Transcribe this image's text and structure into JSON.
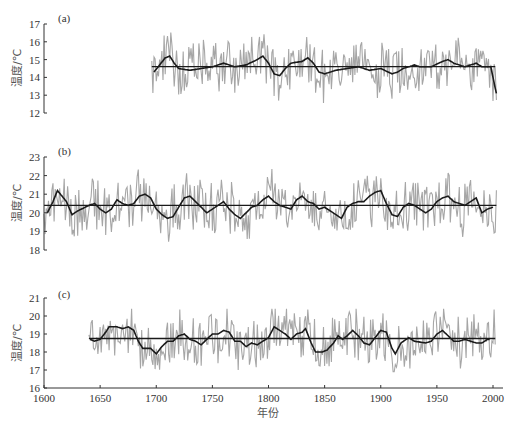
{
  "figure": {
    "xlabel": "年份",
    "x_ticks": [
      "1600",
      "1650",
      "1700",
      "1750",
      "1800",
      "1850",
      "1900",
      "1950",
      "2000"
    ],
    "colors": {
      "raw": "#a6a6a6",
      "smooth": "#1a1a1a",
      "mean": "#1a1a1a",
      "axis": "#333333"
    }
  },
  "chart_data": [
    {
      "type": "line",
      "panel": "(a)",
      "title": "",
      "xlabel": "",
      "ylabel": "温度/℃",
      "xlim": [
        1600,
        2005
      ],
      "ylim": [
        12,
        17
      ],
      "y_ticks": [
        "12",
        "13",
        "14",
        "15",
        "16",
        "17"
      ],
      "series": [
        {
          "name": "annual",
          "start": 1696,
          "end": 2003,
          "mean": 14.6,
          "min": 12.4,
          "max": 17.3
        },
        {
          "name": "smoothed",
          "start": 1698,
          "end": 2003,
          "points": [
            [
              1698,
              14.3
            ],
            [
              1703,
              14.7
            ],
            [
              1708,
              15.1
            ],
            [
              1712,
              15.2
            ],
            [
              1716,
              14.8
            ],
            [
              1720,
              14.5
            ],
            [
              1730,
              14.4
            ],
            [
              1740,
              14.5
            ],
            [
              1750,
              14.6
            ],
            [
              1760,
              14.8
            ],
            [
              1765,
              14.7
            ],
            [
              1770,
              14.6
            ],
            [
              1780,
              14.7
            ],
            [
              1790,
              15.0
            ],
            [
              1795,
              15.2
            ],
            [
              1800,
              14.8
            ],
            [
              1805,
              14.2
            ],
            [
              1810,
              14.1
            ],
            [
              1815,
              14.5
            ],
            [
              1820,
              14.8
            ],
            [
              1830,
              14.9
            ],
            [
              1835,
              15.1
            ],
            [
              1840,
              14.8
            ],
            [
              1845,
              14.3
            ],
            [
              1850,
              14.2
            ],
            [
              1860,
              14.4
            ],
            [
              1870,
              14.5
            ],
            [
              1880,
              14.6
            ],
            [
              1890,
              14.4
            ],
            [
              1900,
              14.5
            ],
            [
              1910,
              14.2
            ],
            [
              1915,
              14.3
            ],
            [
              1920,
              14.5
            ],
            [
              1930,
              14.7
            ],
            [
              1935,
              14.6
            ],
            [
              1945,
              14.6
            ],
            [
              1955,
              14.9
            ],
            [
              1960,
              15.0
            ],
            [
              1965,
              14.8
            ],
            [
              1975,
              14.6
            ],
            [
              1985,
              14.8
            ],
            [
              1990,
              14.6
            ],
            [
              1998,
              14.6
            ],
            [
              2003,
              13.1
            ]
          ]
        },
        {
          "name": "mean",
          "value": 14.6,
          "start": 1696,
          "end": 2002
        }
      ]
    },
    {
      "type": "line",
      "panel": "(b)",
      "ylabel": "温度/℃",
      "xlim": [
        1600,
        2005
      ],
      "ylim": [
        18,
        23
      ],
      "y_ticks": [
        "18",
        "19",
        "20",
        "21",
        "22",
        "23"
      ],
      "series": [
        {
          "name": "annual",
          "start": 1600,
          "end": 2003,
          "mean": 20.4,
          "min": 18.1,
          "max": 22.6
        },
        {
          "name": "smoothed",
          "start": 1603,
          "end": 2000,
          "points": [
            [
              1603,
              20.0
            ],
            [
              1608,
              20.6
            ],
            [
              1612,
              21.2
            ],
            [
              1616,
              20.9
            ],
            [
              1620,
              20.6
            ],
            [
              1625,
              19.9
            ],
            [
              1630,
              20.1
            ],
            [
              1640,
              20.4
            ],
            [
              1645,
              20.5
            ],
            [
              1650,
              20.2
            ],
            [
              1655,
              20.0
            ],
            [
              1660,
              20.2
            ],
            [
              1665,
              20.7
            ],
            [
              1670,
              20.5
            ],
            [
              1675,
              20.4
            ],
            [
              1680,
              20.5
            ],
            [
              1685,
              20.9
            ],
            [
              1690,
              21.0
            ],
            [
              1695,
              20.8
            ],
            [
              1700,
              20.2
            ],
            [
              1705,
              19.9
            ],
            [
              1710,
              19.7
            ],
            [
              1715,
              19.8
            ],
            [
              1720,
              20.3
            ],
            [
              1725,
              20.8
            ],
            [
              1730,
              20.9
            ],
            [
              1735,
              20.6
            ],
            [
              1740,
              20.3
            ],
            [
              1745,
              20.0
            ],
            [
              1750,
              20.2
            ],
            [
              1755,
              20.4
            ],
            [
              1760,
              20.6
            ],
            [
              1765,
              20.2
            ],
            [
              1770,
              19.9
            ],
            [
              1775,
              19.7
            ],
            [
              1780,
              20.0
            ],
            [
              1785,
              20.3
            ],
            [
              1790,
              20.4
            ],
            [
              1795,
              20.7
            ],
            [
              1800,
              20.9
            ],
            [
              1805,
              20.6
            ],
            [
              1810,
              20.4
            ],
            [
              1815,
              20.3
            ],
            [
              1820,
              20.2
            ],
            [
              1825,
              20.7
            ],
            [
              1830,
              20.9
            ],
            [
              1835,
              20.6
            ],
            [
              1840,
              20.5
            ],
            [
              1845,
              20.2
            ],
            [
              1850,
              20.3
            ],
            [
              1855,
              20.1
            ],
            [
              1860,
              19.9
            ],
            [
              1865,
              19.7
            ],
            [
              1870,
              20.3
            ],
            [
              1875,
              20.5
            ],
            [
              1880,
              20.6
            ],
            [
              1885,
              20.6
            ],
            [
              1890,
              20.9
            ],
            [
              1895,
              21.1
            ],
            [
              1900,
              21.2
            ],
            [
              1905,
              20.5
            ],
            [
              1910,
              19.9
            ],
            [
              1915,
              19.8
            ],
            [
              1920,
              20.3
            ],
            [
              1925,
              20.5
            ],
            [
              1930,
              20.4
            ],
            [
              1935,
              20.2
            ],
            [
              1940,
              20.0
            ],
            [
              1945,
              20.2
            ],
            [
              1950,
              20.6
            ],
            [
              1955,
              20.8
            ],
            [
              1960,
              20.9
            ],
            [
              1965,
              20.6
            ],
            [
              1970,
              20.5
            ],
            [
              1975,
              20.4
            ],
            [
              1980,
              20.6
            ],
            [
              1985,
              20.8
            ],
            [
              1990,
              20.0
            ],
            [
              1995,
              20.2
            ],
            [
              2000,
              20.3
            ]
          ]
        },
        {
          "name": "mean",
          "value": 20.4,
          "start": 1600,
          "end": 2003
        }
      ]
    },
    {
      "type": "line",
      "panel": "(c)",
      "ylabel": "温度/℃",
      "xlim": [
        1600,
        2005
      ],
      "ylim": [
        16,
        21
      ],
      "y_ticks": [
        "16",
        "17",
        "18",
        "19",
        "20",
        "21"
      ],
      "series": [
        {
          "name": "annual",
          "start": 1640,
          "end": 2002,
          "mean": 18.75,
          "min": 16.9,
          "max": 20.4
        },
        {
          "name": "smoothed",
          "start": 1641,
          "end": 1997,
          "points": [
            [
              1641,
              18.7
            ],
            [
              1645,
              18.6
            ],
            [
              1650,
              18.7
            ],
            [
              1655,
              19.1
            ],
            [
              1658,
              19.4
            ],
            [
              1665,
              19.4
            ],
            [
              1670,
              19.3
            ],
            [
              1675,
              19.4
            ],
            [
              1680,
              19.2
            ],
            [
              1684,
              18.6
            ],
            [
              1688,
              18.2
            ],
            [
              1695,
              18.2
            ],
            [
              1700,
              17.9
            ],
            [
              1705,
              18.3
            ],
            [
              1710,
              18.6
            ],
            [
              1715,
              18.6
            ],
            [
              1720,
              18.9
            ],
            [
              1725,
              19.0
            ],
            [
              1730,
              18.7
            ],
            [
              1735,
              18.6
            ],
            [
              1740,
              18.4
            ],
            [
              1745,
              18.7
            ],
            [
              1750,
              19.0
            ],
            [
              1755,
              19.0
            ],
            [
              1760,
              19.2
            ],
            [
              1765,
              19.1
            ],
            [
              1770,
              18.6
            ],
            [
              1775,
              18.6
            ],
            [
              1780,
              18.3
            ],
            [
              1785,
              18.5
            ],
            [
              1790,
              18.4
            ],
            [
              1795,
              18.6
            ],
            [
              1800,
              18.8
            ],
            [
              1805,
              19.4
            ],
            [
              1810,
              19.2
            ],
            [
              1815,
              19.0
            ],
            [
              1820,
              18.7
            ],
            [
              1825,
              19.0
            ],
            [
              1830,
              19.1
            ],
            [
              1833,
              19.3
            ],
            [
              1838,
              18.5
            ],
            [
              1842,
              18.0
            ],
            [
              1848,
              18.0
            ],
            [
              1852,
              18.1
            ],
            [
              1858,
              18.5
            ],
            [
              1862,
              18.9
            ],
            [
              1866,
              18.7
            ],
            [
              1870,
              18.9
            ],
            [
              1875,
              19.2
            ],
            [
              1880,
              18.9
            ],
            [
              1885,
              18.5
            ],
            [
              1890,
              18.4
            ],
            [
              1895,
              18.8
            ],
            [
              1900,
              19.2
            ],
            [
              1905,
              19.1
            ],
            [
              1910,
              18.2
            ],
            [
              1913,
              17.9
            ],
            [
              1918,
              18.5
            ],
            [
              1925,
              18.8
            ],
            [
              1930,
              18.6
            ],
            [
              1940,
              18.5
            ],
            [
              1945,
              18.6
            ],
            [
              1950,
              19.0
            ],
            [
              1955,
              19.2
            ],
            [
              1960,
              18.9
            ],
            [
              1965,
              18.6
            ],
            [
              1970,
              18.6
            ],
            [
              1975,
              18.7
            ],
            [
              1980,
              18.6
            ],
            [
              1985,
              18.5
            ],
            [
              1990,
              18.5
            ],
            [
              1995,
              18.7
            ]
          ]
        },
        {
          "name": "mean",
          "value": 18.75,
          "start": 1640,
          "end": 2002
        }
      ]
    }
  ]
}
